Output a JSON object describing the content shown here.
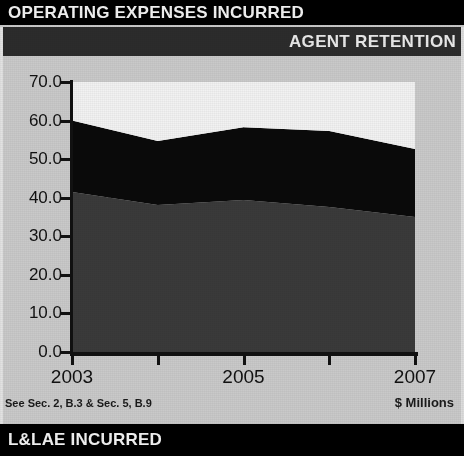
{
  "banners": {
    "top_title": "OPERATING EXPENSES INCURRED",
    "sub_title": "AGENT RETENTION",
    "bottom_title": "L&LAE INCURRED"
  },
  "footer": {
    "note": "See Sec. 2, B.3 & Sec. 5, B.9",
    "units": "$ Millions"
  },
  "chart_data": {
    "type": "area",
    "stacked": true,
    "title": "AGENT RETENTION",
    "xlabel": "",
    "ylabel": "$ Millions",
    "ylim": [
      0.0,
      70.0
    ],
    "yticks": [
      "0.0",
      "10.0",
      "20.0",
      "30.0",
      "40.0",
      "50.0",
      "60.0",
      "70.0"
    ],
    "ytick_values": [
      0.0,
      10.0,
      20.0,
      30.0,
      40.0,
      50.0,
      60.0,
      70.0
    ],
    "x": [
      2003,
      2004,
      2005,
      2006,
      2007
    ],
    "xtick_labels": [
      "2003",
      "",
      "2005",
      "",
      "2007"
    ],
    "grid": "both",
    "legend": "none",
    "series": [
      {
        "name": "bottom-band",
        "color": "#3a3a3a",
        "values": [
          41.5,
          38.1,
          39.4,
          37.6,
          35.0
        ]
      },
      {
        "name": "middle-band",
        "color": "#0a0a0a",
        "values": [
          18.5,
          16.6,
          18.9,
          19.7,
          17.6
        ]
      },
      {
        "name": "top-band",
        "color": "#f2f2f2",
        "values": [
          10.0,
          15.3,
          11.7,
          12.7,
          17.4
        ]
      }
    ],
    "cumulative_tops": [
      60.0,
      54.7,
      58.3,
      57.3,
      52.6
    ],
    "plot_background": "#e8e8e8"
  }
}
